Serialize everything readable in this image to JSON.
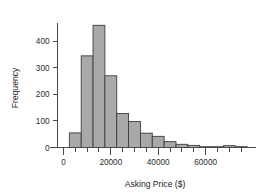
{
  "chart_data": {
    "type": "bar",
    "title": "",
    "subtitle": "",
    "xlabel": "Asking Price ($)",
    "ylabel": "Frequency",
    "grid": false,
    "legend": null,
    "bin_width": 5000,
    "xlim": [
      -2500,
      80000
    ],
    "ylim": [
      0,
      480
    ],
    "x_ticks_major": [
      0,
      20000,
      40000,
      60000
    ],
    "x_tick_labels": [
      "0",
      "20000",
      "40000",
      "60000"
    ],
    "x_ticks_minor": [
      5000,
      10000,
      15000,
      25000,
      30000,
      35000,
      45000,
      50000,
      55000,
      65000,
      70000,
      75000
    ],
    "y_ticks": [
      0,
      100,
      200,
      300,
      400
    ],
    "y_tick_labels": [
      "0",
      "100",
      "200",
      "300",
      "400"
    ],
    "bin_starts": [
      2500,
      7500,
      12500,
      17500,
      22500,
      27500,
      32500,
      37500,
      42500,
      47500,
      52500,
      57500,
      62500,
      67500,
      72500
    ],
    "categories": [
      "2500-7500",
      "7500-12500",
      "12500-17500",
      "17500-22500",
      "22500-27500",
      "27500-32500",
      "32500-37500",
      "37500-42500",
      "42500-47500",
      "47500-52500",
      "52500-57500",
      "57500-62500",
      "62500-67500",
      "67500-72500",
      "72500-77500"
    ],
    "values": [
      55,
      345,
      460,
      270,
      128,
      98,
      54,
      42,
      22,
      12,
      8,
      3,
      3,
      7,
      3
    ],
    "colors": {
      "bar_fill": "#a9a9a9",
      "bar_stroke": "#3d3d3d",
      "axis": "#4a4a4a",
      "text": "#1c1c1c",
      "background": "#ffffff"
    }
  }
}
